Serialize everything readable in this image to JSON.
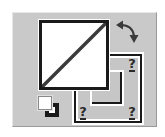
{
  "widget": {
    "name": "color-swatch-selector",
    "frame_color": "#c9c9c9",
    "foreground": {
      "label": "Foreground color",
      "state": "none",
      "fill": "#ffffff",
      "border": "#1a1a1a",
      "diagonal_color": "#3a3a3a"
    },
    "background": {
      "label": "Background color",
      "state": "unknown",
      "fill": "#c6c6c6",
      "border": "#1a1a1a",
      "markers": [
        "?",
        "?",
        "?"
      ]
    },
    "icons": {
      "swap": "swap-colors-icon",
      "default": "default-colors-icon"
    }
  }
}
